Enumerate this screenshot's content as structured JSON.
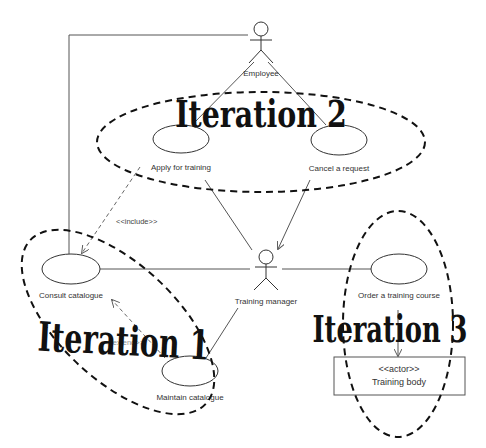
{
  "diagram": {
    "type": "UML use case diagram",
    "actors": [
      {
        "id": "employee",
        "label": "Employee"
      },
      {
        "id": "training_manager",
        "label": "Training manager"
      },
      {
        "id": "training_body",
        "stereotype": "<<actor>>",
        "label": "Training body"
      }
    ],
    "use_cases": [
      {
        "id": "apply",
        "label": "Apply for training"
      },
      {
        "id": "cancel",
        "label": "Cancel a request"
      },
      {
        "id": "consult",
        "label": "Consult catalogue"
      },
      {
        "id": "maintain",
        "label": "Maintain catalogue"
      },
      {
        "id": "order",
        "label": "Order a training course"
      }
    ],
    "relationships": [
      {
        "from": "employee",
        "to": "apply",
        "kind": "association"
      },
      {
        "from": "employee",
        "to": "cancel",
        "kind": "association"
      },
      {
        "from": "employee",
        "to": "consult",
        "kind": "association"
      },
      {
        "from": "apply",
        "to": "consult",
        "kind": "dependency",
        "label": "<<include>>"
      },
      {
        "from": "maintain",
        "to": "consult",
        "kind": "dependency",
        "label": "<<extend>>"
      },
      {
        "from": "training_manager",
        "to": "apply",
        "kind": "association"
      },
      {
        "from": "cancel",
        "to": "training_manager",
        "kind": "directed-association"
      },
      {
        "from": "training_manager",
        "to": "consult",
        "kind": "association"
      },
      {
        "from": "training_manager",
        "to": "maintain",
        "kind": "association"
      },
      {
        "from": "training_manager",
        "to": "order",
        "kind": "association"
      },
      {
        "from": "order",
        "to": "training_body",
        "kind": "directed-association"
      }
    ],
    "iterations": [
      {
        "id": "iteration1",
        "label": "Iteration 1",
        "contains": [
          "consult",
          "maintain"
        ]
      },
      {
        "id": "iteration2",
        "label": "Iteration 2",
        "contains": [
          "apply",
          "cancel"
        ]
      },
      {
        "id": "iteration3",
        "label": "Iteration 3",
        "contains": [
          "order",
          "training_body"
        ]
      }
    ]
  },
  "labels": {
    "employee": "Employee",
    "training_manager": "Training manager",
    "training_body_stereotype": "<<actor>>",
    "training_body": "Training body",
    "apply": "Apply for training",
    "cancel": "Cancel a request",
    "consult": "Consult catalogue",
    "maintain": "Maintain catalogue",
    "order": "Order a training course",
    "include": "<<include>>",
    "extend": "<<extend>>",
    "iteration1": "Iteration 1",
    "iteration2": "Iteration 2",
    "iteration3": "Iteration 3"
  }
}
